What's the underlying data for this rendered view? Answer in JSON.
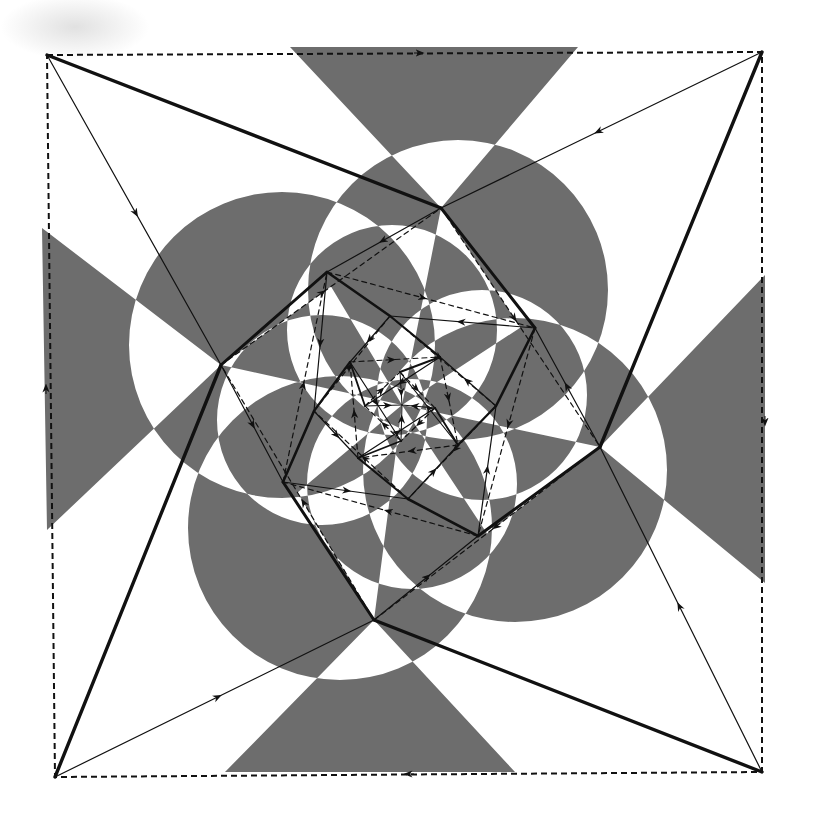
{
  "diagram": {
    "type": "spiral-pursuit-figure",
    "colors": {
      "background": "#ffffff",
      "shade": "#6d6d6d",
      "line": "#111111"
    },
    "frame": {
      "style": "dashed",
      "corners": [
        [
          47,
          55
        ],
        [
          762,
          52
        ],
        [
          762,
          772
        ],
        [
          55,
          777
        ]
      ],
      "edge_arrows": [
        {
          "at": [
            420,
            53
          ],
          "direction": "right"
        },
        {
          "at": [
            765,
            422
          ],
          "direction": "down"
        },
        {
          "at": [
            408,
            774
          ],
          "direction": "left"
        },
        {
          "at": [
            46,
            388
          ],
          "direction": "up"
        }
      ]
    },
    "center": [
      402,
      405
    ],
    "levels": [
      {
        "name": "outer-square",
        "points": [
          [
            47,
            55
          ],
          [
            762,
            52
          ],
          [
            762,
            772
          ],
          [
            55,
            777
          ]
        ]
      },
      {
        "name": "level-1",
        "points": [
          [
            441,
            208
          ],
          [
            600,
            447
          ],
          [
            374,
            620
          ],
          [
            221,
            365
          ]
        ]
      },
      {
        "name": "level-2",
        "points": [
          [
            535,
            328
          ],
          [
            478,
            536
          ],
          [
            283,
            482
          ],
          [
            327,
            272
          ]
        ]
      },
      {
        "name": "level-3",
        "points": [
          [
            496,
            406
          ],
          [
            408,
            499
          ],
          [
            314,
            411
          ],
          [
            390,
            316
          ]
        ]
      },
      {
        "name": "level-4",
        "points": [
          [
            458,
            445
          ],
          [
            358,
            458
          ],
          [
            350,
            362
          ],
          [
            440,
            357
          ]
        ]
      },
      {
        "name": "level-5",
        "points": [
          [
            435,
            408
          ],
          [
            401,
            441
          ],
          [
            365,
            406
          ],
          [
            400,
            372
          ]
        ]
      }
    ],
    "wedges": [
      {
        "name": "top-wedge",
        "points": [
          [
            290,
            47
          ],
          [
            578,
            47
          ],
          [
            441,
            208
          ]
        ]
      },
      {
        "name": "right-wedge",
        "points": [
          [
            765,
            275
          ],
          [
            765,
            583
          ],
          [
            600,
            447
          ]
        ]
      },
      {
        "name": "bottom-wedge",
        "points": [
          [
            515,
            772
          ],
          [
            225,
            772
          ],
          [
            374,
            620
          ]
        ]
      },
      {
        "name": "left-wedge",
        "points": [
          [
            42,
            228
          ],
          [
            47,
            530
          ],
          [
            221,
            365
          ]
        ]
      }
    ],
    "circles": [
      {
        "name": "upper-left-circle",
        "cx": 282,
        "cy": 345,
        "r": 153
      },
      {
        "name": "upper-right-circle",
        "cx": 458,
        "cy": 290,
        "r": 150
      },
      {
        "name": "lower-right-circle",
        "cx": 515,
        "cy": 470,
        "r": 152
      },
      {
        "name": "lower-left-circle",
        "cx": 340,
        "cy": 528,
        "r": 152
      },
      {
        "name": "inner-top-circle",
        "cx": 392,
        "cy": 330,
        "r": 105
      },
      {
        "name": "inner-right-circle",
        "cx": 482,
        "cy": 395,
        "r": 105
      },
      {
        "name": "inner-bottom-circle",
        "cx": 412,
        "cy": 484,
        "r": 105
      },
      {
        "name": "inner-left-circle",
        "cx": 322,
        "cy": 420,
        "r": 105
      }
    ]
  }
}
